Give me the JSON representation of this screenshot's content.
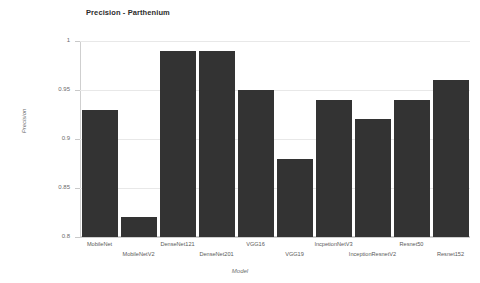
{
  "chart_data": {
    "type": "bar",
    "title": "Precision - Parthenium",
    "xlabel": "Model",
    "ylabel": "Precision",
    "categories": [
      "MobileNet",
      "MobileNetV2",
      "DenseNet121",
      "DenseNet201",
      "VGG16",
      "VGG19",
      "IncpetionNetV3",
      "InceptionResnetV2",
      "Resnet50",
      "Resnet152"
    ],
    "values": [
      0.93,
      0.82,
      0.99,
      0.99,
      0.95,
      0.88,
      0.94,
      0.92,
      0.94,
      0.96
    ],
    "ylim": [
      0.8,
      1.0
    ],
    "yticks": [
      "0.8",
      "0.85",
      "0.9",
      "0.95",
      "1"
    ],
    "ytick_values": [
      0.8,
      0.85,
      0.9,
      0.95,
      1.0
    ],
    "grid": true,
    "legend": false,
    "bar_color": "#333333",
    "grid_color": "#e8e8e8",
    "background": "#ffffff"
  }
}
